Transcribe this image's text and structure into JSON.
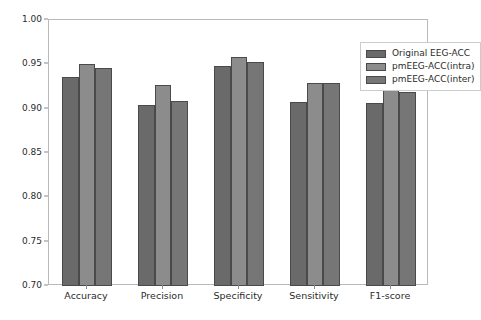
{
  "chart_data": {
    "type": "bar",
    "title": "",
    "xlabel": "",
    "ylabel": "",
    "categories": [
      "Accuracy",
      "Precision",
      "Specificity",
      "Sensitivity",
      "F1-score"
    ],
    "series": [
      {
        "name": "Original EEG-ACC",
        "color": "#6a6a6a",
        "values": [
          0.936,
          0.904,
          0.948,
          0.908,
          0.906
        ]
      },
      {
        "name": "pmEEG-ACC(intra)",
        "color": "#8c8c8c",
        "values": [
          0.95,
          0.927,
          0.958,
          0.929,
          0.929
        ]
      },
      {
        "name": "pmEEG-ACC(inter)",
        "color": "#767676",
        "values": [
          0.946,
          0.909,
          0.953,
          0.929,
          0.919
        ]
      }
    ],
    "ylim": [
      0.7,
      1.0
    ],
    "yticks": [
      0.7,
      0.75,
      0.8,
      0.85,
      0.9,
      0.95,
      1.0
    ],
    "ytick_labels": [
      "0.70",
      "0.75",
      "0.80",
      "0.85",
      "0.90",
      "0.95",
      "1.00"
    ],
    "grid": false,
    "legend_position": "upper right",
    "bar_edge_color": "#4a4a4a",
    "axis_color": "#b9b9b9"
  }
}
